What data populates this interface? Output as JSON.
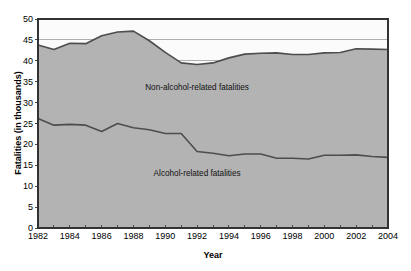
{
  "chart_data": {
    "type": "area",
    "title": "",
    "xlabel": "Year",
    "ylabel": "Fatalities (in thousands)",
    "xlim": [
      1982,
      2004
    ],
    "ylim": [
      0,
      50
    ],
    "ytick_step": 5,
    "grid": true,
    "legend_position": "inline-annotations",
    "stacked": true,
    "x": [
      1982,
      1983,
      1984,
      1985,
      1986,
      1987,
      1988,
      1989,
      1990,
      1991,
      1992,
      1993,
      1994,
      1995,
      1996,
      1997,
      1998,
      1999,
      2000,
      2001,
      2002,
      2003,
      2004
    ],
    "yticks": [
      0,
      5,
      10,
      15,
      20,
      25,
      30,
      35,
      40,
      45,
      50
    ],
    "xticklabels": [
      "1982",
      "1984",
      "1986",
      "1988",
      "1990",
      "1992",
      "1994",
      "1996",
      "1998",
      "2000",
      "2002",
      "2004"
    ],
    "xticklabel_years": [
      1982,
      1984,
      1986,
      1988,
      1990,
      1992,
      1994,
      1996,
      1998,
      2000,
      2002,
      2004
    ],
    "series": [
      {
        "name": "Alcohol-related fatalities",
        "label": "Alcohol-related fatalities",
        "color": "#b3b3b3",
        "line_color": "#4d4d4d",
        "values": [
          26.2,
          24.6,
          24.8,
          24.6,
          23.1,
          25.0,
          24.0,
          23.5,
          22.6,
          22.6,
          18.3,
          17.9,
          17.3,
          17.7,
          17.7,
          16.7,
          16.7,
          16.5,
          17.4,
          17.4,
          17.5,
          17.1,
          16.9
        ]
      },
      {
        "name": "Non-alcohol-related fatalities",
        "label": "Non-alcohol-related fatalities",
        "color": "#b3b3b3",
        "line_color": "#4d4d4d",
        "values": [
          17.6,
          18.1,
          19.4,
          19.5,
          22.9,
          21.9,
          23.1,
          21.3,
          19.4,
          16.9,
          20.8,
          21.6,
          23.4,
          23.9,
          24.1,
          25.2,
          24.8,
          25.0,
          24.5,
          24.6,
          25.4,
          25.7,
          25.8
        ]
      }
    ],
    "totals": [
      43.8,
      42.7,
      44.2,
      44.1,
      46.0,
      46.9,
      47.1,
      44.8,
      42.0,
      39.5,
      39.1,
      39.5,
      40.7,
      41.6,
      41.8,
      41.9,
      41.5,
      41.5,
      41.9,
      42.0,
      42.9,
      42.8,
      42.7
    ],
    "annotations": [
      {
        "text": "Non-alcohol-related fatalities",
        "x": 1992.0,
        "y": 33.0
      },
      {
        "text": "Alcohol-related fatalities",
        "x": 1992.0,
        "y": 12.5
      }
    ]
  },
  "axes": {
    "y_axis_title": "Fatalities (in thousands)",
    "x_axis_title": "Year"
  },
  "colors": {
    "area_fill": "#b3b3b3",
    "line": "#4d4d4d",
    "grid": "#8f8f8f",
    "axis": "#333333",
    "background": "#ffffff",
    "upper_band": "#fbfbfb"
  }
}
